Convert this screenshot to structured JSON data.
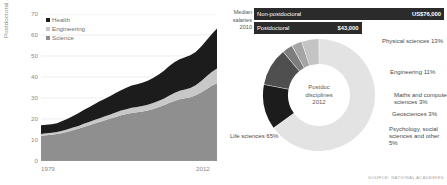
{
  "left_chart": {
    "ylabel": "Postdoctoral appointees (thousands)",
    "yticks": [
      "70",
      "60",
      "50",
      "40",
      "30",
      "20",
      "10",
      "0"
    ],
    "xticks": [
      "1979",
      "2012"
    ],
    "legend": [
      {
        "label": "Health",
        "color": "#1c1c1c"
      },
      {
        "label": "Engineering",
        "color": "#c8c8c8"
      },
      {
        "label": "Science",
        "color": "#8f8f8f"
      }
    ]
  },
  "salaries": {
    "caption_line1": "Median",
    "caption_line2": "salaries",
    "caption_line3": "2010",
    "bars": [
      {
        "label": "Non-postdoctoral",
        "value": "US$76,000",
        "amount": 76000
      },
      {
        "label": "Postdoctoral",
        "value": "$43,000",
        "amount": 43000
      }
    ]
  },
  "donut": {
    "center_line1": "Postdoc",
    "center_line2": "disciplines",
    "center_line3": "2012",
    "labels": {
      "physical": "Physical sciences  13%",
      "engineering": "Engineering  11%",
      "maths": "Maths and computer sciences  3%",
      "geosciences": "Geosciences  3%",
      "psychology": "Psychology, social sciences and other  5%",
      "life": "Life sciences 65%"
    }
  },
  "source": "SOURCE: NATIONAL ACADEMIES",
  "chart_data": [
    {
      "type": "area",
      "title": "",
      "xlabel": "",
      "ylabel": "Postdoctoral appointees (thousands)",
      "xlim": [
        1979,
        2012
      ],
      "ylim": [
        0,
        70
      ],
      "yticks": [
        0,
        10,
        20,
        30,
        40,
        50,
        60,
        70
      ],
      "xticks": [
        1979,
        2012
      ],
      "grid": true,
      "legend_position": "top-left",
      "stacked": true,
      "x": [
        1979,
        1980,
        1981,
        1982,
        1983,
        1984,
        1985,
        1986,
        1987,
        1988,
        1989,
        1990,
        1991,
        1992,
        1993,
        1994,
        1995,
        1996,
        1997,
        1998,
        1999,
        2000,
        2001,
        2002,
        2003,
        2004,
        2005,
        2006,
        2007,
        2008,
        2009,
        2010,
        2011,
        2012
      ],
      "series": [
        {
          "name": "Science",
          "color": "#8f8f8f",
          "values": [
            12.0,
            12.3,
            12.5,
            12.8,
            13.3,
            13.9,
            14.6,
            15.3,
            16.2,
            17.0,
            17.8,
            18.6,
            19.4,
            20.2,
            21.0,
            21.8,
            22.4,
            22.9,
            23.2,
            23.6,
            24.1,
            24.8,
            25.6,
            26.5,
            27.6,
            28.6,
            29.4,
            29.9,
            30.4,
            31.3,
            32.6,
            34.2,
            35.8,
            37.0
          ]
        },
        {
          "name": "Engineering",
          "color": "#c8c8c8",
          "values": [
            0.9,
            0.9,
            1.0,
            1.0,
            1.1,
            1.2,
            1.3,
            1.4,
            1.5,
            1.6,
            1.7,
            1.8,
            1.9,
            2.0,
            2.1,
            2.2,
            2.3,
            2.4,
            2.5,
            2.6,
            2.7,
            2.8,
            3.0,
            3.2,
            3.5,
            3.8,
            4.0,
            4.2,
            4.4,
            4.8,
            5.4,
            6.0,
            6.6,
            7.1
          ]
        },
        {
          "name": "Health",
          "color": "#1c1c1c",
          "values": [
            4.1,
            4.1,
            4.0,
            4.2,
            4.6,
            5.0,
            5.5,
            6.0,
            6.6,
            7.0,
            7.5,
            8.0,
            8.4,
            8.7,
            9.3,
            9.7,
            10.2,
            10.6,
            10.8,
            11.1,
            11.4,
            11.9,
            12.5,
            13.2,
            14.0,
            14.6,
            15.0,
            15.3,
            15.5,
            15.8,
            16.4,
            17.2,
            18.0,
            19.0
          ]
        }
      ]
    },
    {
      "type": "bar",
      "title": "Median salaries 2010",
      "orientation": "horizontal",
      "categories": [
        "Non-postdoctoral",
        "Postdoctoral"
      ],
      "values": [
        76000,
        43000
      ],
      "value_labels": [
        "US$76,000",
        "$43,000"
      ],
      "xlabel": "",
      "ylabel": "",
      "xlim": [
        0,
        76000
      ]
    },
    {
      "type": "pie",
      "title": "Postdoc disciplines 2012",
      "donut": true,
      "labels": [
        "Life sciences",
        "Physical sciences",
        "Engineering",
        "Maths and computer sciences",
        "Geosciences",
        "Psychology, social sciences and other"
      ],
      "values": [
        65,
        13,
        11,
        3,
        3,
        5
      ],
      "unit": "%",
      "colors": [
        "#e3e3e3",
        "#1c1c1c",
        "#4f4f4f",
        "#7d7d7d",
        "#a5a5a5",
        "#c4c4c4"
      ]
    }
  ]
}
